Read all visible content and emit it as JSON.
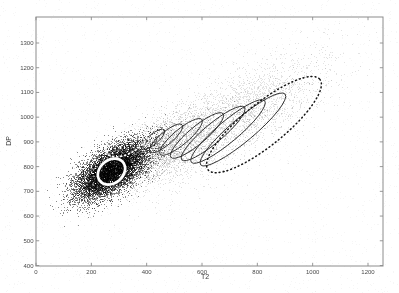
{
  "figure": {
    "background": "#ffffff",
    "axis_color": "#8c8c8c",
    "tick_label_color": "#4a4a4a"
  },
  "chart_data": {
    "type": "scatter",
    "title": "",
    "xlabel": "T2",
    "ylabel": "DP",
    "xlim": [
      0,
      1254
    ],
    "ylim": [
      398,
      1405
    ],
    "xticks": [
      0,
      200,
      400,
      600,
      800,
      1000,
      1200
    ],
    "yticks": [
      400,
      500,
      600,
      700,
      800,
      900,
      1000,
      1100,
      1200,
      1300
    ],
    "grid": false,
    "legend": null,
    "cloud": {
      "components": [
        {
          "name": "diffuse-tail",
          "mu": [
            700,
            985
          ],
          "sigma": [
            175,
            130
          ],
          "rho": 0.75,
          "n": 3200,
          "alpha": 0.11
        },
        {
          "name": "bridge",
          "mu": [
            450,
            872
          ],
          "sigma": [
            95,
            80
          ],
          "rho": 0.65,
          "n": 2200,
          "alpha": 0.13
        },
        {
          "name": "dense-core",
          "mu": [
            275,
            784
          ],
          "sigma": [
            65,
            58
          ],
          "rho": 0.62,
          "n": 9000,
          "alpha": 0.45
        }
      ],
      "speckle": {
        "n": 2600,
        "alpha": 0.045
      }
    },
    "ellipses": [
      {
        "name": "iteration-ellipse-1",
        "style": "solid-black",
        "cx": 423,
        "cy": 910,
        "a": 54,
        "b": 18,
        "angle": 40
      },
      {
        "name": "iteration-ellipse-2",
        "style": "solid-black",
        "cx": 470,
        "cy": 914,
        "a": 76,
        "b": 23,
        "angle": 40
      },
      {
        "name": "iteration-ellipse-3",
        "style": "solid-black",
        "cx": 524,
        "cy": 920,
        "a": 98,
        "b": 27,
        "angle": 40
      },
      {
        "name": "iteration-ellipse-4",
        "style": "solid-black",
        "cx": 582,
        "cy": 926,
        "a": 123,
        "b": 31,
        "angle": 40
      },
      {
        "name": "iteration-ellipse-5",
        "style": "solid-black",
        "cx": 640,
        "cy": 934,
        "a": 148,
        "b": 34,
        "angle": 40
      },
      {
        "name": "iteration-ellipse-6",
        "style": "solid-black",
        "cx": 694,
        "cy": 942,
        "a": 173,
        "b": 38,
        "angle": 40
      },
      {
        "name": "iteration-ellipse-7",
        "style": "solid-black",
        "cx": 748,
        "cy": 950,
        "a": 199,
        "b": 42,
        "angle": 40
      },
      {
        "name": "initial-ellipse-dashed",
        "style": "dashed-black",
        "cx": 824,
        "cy": 970,
        "a": 260,
        "b": 76,
        "angle": 39
      },
      {
        "name": "white-dotted-ellipse",
        "style": "dotted-white",
        "cx": 329,
        "cy": 902,
        "a": 83,
        "b": 43,
        "angle": 30
      },
      {
        "name": "final-ellipse-white",
        "style": "solid-white",
        "cx": 273,
        "cy": 780,
        "a": 54,
        "b": 42,
        "angle": 40
      }
    ]
  }
}
